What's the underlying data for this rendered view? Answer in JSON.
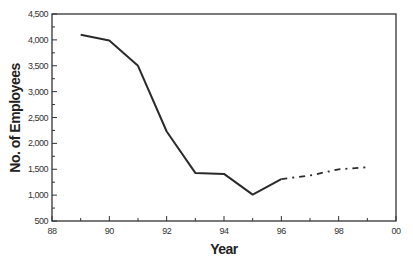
{
  "chart_data": {
    "type": "line",
    "title": "",
    "xlabel": "Year",
    "ylabel": "No. of Employees",
    "xlim": [
      88,
      100
    ],
    "ylim": [
      500,
      4500
    ],
    "x_ticks": [
      88,
      90,
      92,
      94,
      96,
      98,
      100
    ],
    "x_tick_labels": [
      "88",
      "90",
      "92",
      "94",
      "96",
      "98",
      "00"
    ],
    "y_ticks": [
      500,
      1000,
      1500,
      2000,
      2500,
      3000,
      3500,
      4000,
      4500
    ],
    "y_tick_labels": [
      "500",
      "1,000",
      "1,500",
      "2,000",
      "2,500",
      "3,000",
      "3,500",
      "4,000",
      "4,500"
    ],
    "grid": false,
    "legend": null,
    "series": [
      {
        "name": "Actual",
        "style": "solid",
        "x": [
          89,
          90,
          91,
          92,
          93,
          94,
          95,
          96
        ],
        "values": [
          4100,
          3990,
          3500,
          2230,
          1430,
          1410,
          1010,
          1310
        ]
      },
      {
        "name": "Projected",
        "style": "dash-dot",
        "x": [
          96,
          97,
          98,
          99
        ],
        "values": [
          1310,
          1380,
          1500,
          1540
        ]
      }
    ]
  }
}
